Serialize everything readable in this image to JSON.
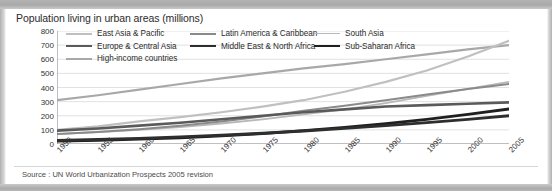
{
  "chart_title": "Population living in urban areas (millions)",
  "source_note": "Source : UN World Urbanization Prospects 2005 revision",
  "colors": {
    "east_asia_pacific": "#c0c0c0",
    "latin_america_caribbean": "#8a8a8a",
    "south_asia": "#b8b8b8",
    "europe_central_asia": "#5a5a5a",
    "middle_east_north_africa": "#2e2e2e",
    "sub_saharan_africa": "#1f1f1f",
    "high_income_countries": "#a8a8a8",
    "gridline": "#d9d9d9",
    "axis": "#808080",
    "text": "#2b2b2b"
  },
  "legend": {
    "items": [
      {
        "label": "East Asia & Pacific",
        "color": "#c0c0c0",
        "width": 2.0,
        "col": 0,
        "row": 0
      },
      {
        "label": "Latin America & Caribbean",
        "color": "#8a8a8a",
        "width": 2.0,
        "col": 1,
        "row": 0
      },
      {
        "label": "South Asia",
        "color": "#b8b8b8",
        "width": 1.6,
        "col": 2,
        "row": 0
      },
      {
        "label": "Europe & Central Asia",
        "color": "#5a5a5a",
        "width": 2.6,
        "col": 0,
        "row": 1
      },
      {
        "label": "Middle East & North Africa",
        "color": "#2e2e2e",
        "width": 2.8,
        "col": 1,
        "row": 1
      },
      {
        "label": "Sub-Saharan Africa",
        "color": "#1f1f1f",
        "width": 2.8,
        "col": 2,
        "row": 1
      },
      {
        "label": "High-income countries",
        "color": "#a8a8a8",
        "width": 2.2,
        "col": 0,
        "row": 2
      }
    ]
  },
  "chart_data": {
    "type": "line",
    "title": "Population living in urban areas (millions)",
    "xlabel": "",
    "ylabel": "",
    "ylim": [
      0,
      800
    ],
    "yticks": [
      0,
      100,
      200,
      300,
      400,
      500,
      600,
      700,
      800
    ],
    "xlim": [
      1950,
      2005
    ],
    "xticks": [
      1950,
      1955,
      1960,
      1965,
      1970,
      1975,
      1980,
      1985,
      1990,
      1995,
      2000,
      2005
    ],
    "xtick_labels": [
      "1950",
      "1955",
      "1960",
      "1965",
      "1970",
      "1975",
      "1980",
      "1985",
      "1990",
      "1995",
      "2000",
      "2005"
    ],
    "minor_tick_interval": 1,
    "grid": true,
    "grid_axis": "y",
    "legend_position": "top",
    "x": [
      1950,
      1955,
      1960,
      1965,
      1970,
      1975,
      1980,
      1985,
      1990,
      1995,
      2000,
      2005
    ],
    "series": [
      {
        "name": "High-income countries",
        "color": "#a8a8a8",
        "width": 2.2,
        "values": [
          310,
          345,
          385,
          425,
          465,
          500,
          535,
          565,
          600,
          635,
          670,
          700
        ]
      },
      {
        "name": "East Asia & Pacific",
        "color": "#c0c0c0",
        "width": 2.2,
        "values": [
          100,
          125,
          160,
          190,
          225,
          265,
          310,
          370,
          440,
          520,
          620,
          730
        ]
      },
      {
        "name": "South Asia",
        "color": "#b8b8b8",
        "width": 1.8,
        "values": [
          70,
          85,
          100,
          120,
          145,
          175,
          210,
          245,
          290,
          340,
          390,
          440
        ]
      },
      {
        "name": "Latin America & Caribbean",
        "color": "#8a8a8a",
        "width": 2.0,
        "values": [
          70,
          85,
          105,
          130,
          160,
          195,
          235,
          270,
          310,
          350,
          390,
          425
        ]
      },
      {
        "name": "Europe & Central Asia",
        "color": "#5a5a5a",
        "width": 2.6,
        "values": [
          95,
          110,
          130,
          150,
          175,
          200,
          225,
          245,
          265,
          275,
          285,
          295
        ]
      },
      {
        "name": "Sub-Saharan Africa",
        "color": "#1f1f1f",
        "width": 2.8,
        "values": [
          20,
          26,
          34,
          44,
          57,
          74,
          95,
          118,
          145,
          175,
          210,
          248
        ]
      },
      {
        "name": "Middle East & North Africa",
        "color": "#2e2e2e",
        "width": 2.8,
        "values": [
          25,
          32,
          40,
          50,
          62,
          76,
          92,
          110,
          130,
          152,
          175,
          200
        ]
      }
    ]
  }
}
